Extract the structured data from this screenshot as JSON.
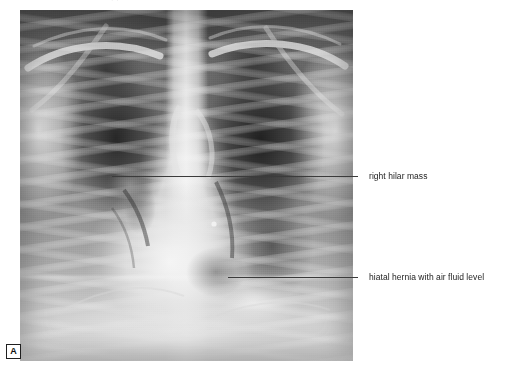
{
  "figure": {
    "panel_letter": "A",
    "modality": "chest-radiograph",
    "view": "PA",
    "plate": {
      "x": 20,
      "y": 10,
      "width": 333,
      "height": 351,
      "background_color": "#6e6e6e"
    },
    "page_background": "#ffffff"
  },
  "caption_crop": {
    "ghost_text": "iiiii ,i, i ii i"
  },
  "annotations": [
    {
      "id": "right-hilar-mass",
      "label": "right hilar mass",
      "leader": {
        "x1": 112,
        "x2": 358,
        "y": 176
      },
      "text_x": 369,
      "text_y": 171,
      "color": "#3b3b3b"
    },
    {
      "id": "hiatal-hernia",
      "label": "hiatal hernia with air fluid level",
      "leader": {
        "x1": 228,
        "x2": 358,
        "y": 277
      },
      "text_x": 369,
      "text_y": 272,
      "color": "#3b3b3b"
    }
  ],
  "colors": {
    "annotation_line": "#3b3b3b",
    "annotation_text": "#1d1d1d",
    "panel_letter_border": "#1f1f1f"
  }
}
